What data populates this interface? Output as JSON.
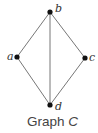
{
  "diagram": {
    "caption": {
      "prefix": "Graph ",
      "variable": "C"
    },
    "colors": {
      "edge": "#777777",
      "node": "#111111",
      "text": "#333333"
    },
    "nodes": [
      {
        "id": "a",
        "label": "a",
        "x": 17,
        "y": 57
      },
      {
        "id": "b",
        "label": "b",
        "x": 50,
        "y": 12
      },
      {
        "id": "c",
        "label": "c",
        "x": 85,
        "y": 58
      },
      {
        "id": "d",
        "label": "d",
        "x": 50,
        "y": 105
      }
    ],
    "edges": [
      {
        "from": "a",
        "to": "b"
      },
      {
        "from": "b",
        "to": "c"
      },
      {
        "from": "a",
        "to": "d"
      },
      {
        "from": "c",
        "to": "d"
      },
      {
        "from": "b",
        "to": "d"
      }
    ]
  }
}
